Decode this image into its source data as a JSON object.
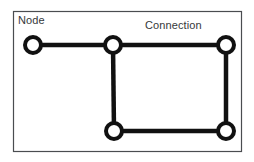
{
  "diagram": {
    "canvas": {
      "width": 254,
      "height": 162,
      "background": "#ffffff"
    },
    "frame": {
      "name": "diagram-border",
      "x": 13.5,
      "y": 11.5,
      "width": 228,
      "height": 140,
      "stroke": "#4a4d50",
      "stroke_width": 1.2,
      "fill": "#ffffff"
    },
    "style": {
      "node_stroke": "#111111",
      "node_fill": "#ffffff",
      "node_stroke_width": 4,
      "node_radius": 8,
      "edge_stroke": "#111111",
      "edge_stroke_width": 4.5,
      "label_color": "#35383a",
      "label_font_size": "11px"
    },
    "labels": [
      {
        "id": "node",
        "text": "Node",
        "x": 18,
        "y": 14
      },
      {
        "id": "connection",
        "text": "Connection",
        "x": 145,
        "y": 19
      }
    ],
    "nodes": [
      {
        "id": "n1",
        "label": "left-node",
        "cx": 33,
        "cy": 45
      },
      {
        "id": "n2",
        "label": "top-center-node",
        "cx": 113,
        "cy": 45
      },
      {
        "id": "n3",
        "label": "top-right-node",
        "cx": 226,
        "cy": 45
      },
      {
        "id": "n4",
        "label": "bottom-center-node",
        "cx": 114,
        "cy": 131
      },
      {
        "id": "n5",
        "label": "bottom-right-node",
        "cx": 226,
        "cy": 131
      }
    ],
    "edges": [
      {
        "id": "e1",
        "label": "left-to-top-center",
        "from": "n1",
        "to": "n2",
        "x1": 33,
        "y1": 45,
        "x2": 113,
        "y2": 45
      },
      {
        "id": "e2",
        "label": "top-center-to-top-right",
        "from": "n2",
        "to": "n3",
        "x1": 113,
        "y1": 45,
        "x2": 226,
        "y2": 45
      },
      {
        "id": "e3",
        "label": "top-center-to-bottom-center",
        "from": "n2",
        "to": "n4",
        "x1": 113,
        "y1": 45,
        "x2": 114,
        "y2": 131
      },
      {
        "id": "e4",
        "label": "top-right-to-bottom-right",
        "from": "n3",
        "to": "n5",
        "x1": 226,
        "y1": 45,
        "x2": 226,
        "y2": 131
      },
      {
        "id": "e5",
        "label": "bottom-center-to-bottom-right",
        "from": "n4",
        "to": "n5",
        "x1": 114,
        "y1": 131,
        "x2": 226,
        "y2": 131
      }
    ]
  }
}
